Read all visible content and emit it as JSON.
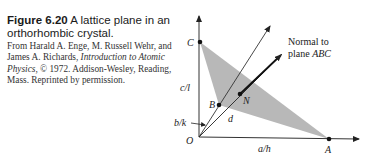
{
  "figure": {
    "number": "Figure 6.20",
    "title": "A lattice plane in an orthorhombic crystal.",
    "credit_pre": "From Harald A. Enge, M. Russell Wehr, and James A. Richards, ",
    "credit_book": "Introduction to Atomic Physics",
    "credit_post": ", © 1972. Addison-Wesley, Reading, Mass. Reprinted by permission."
  },
  "diagram": {
    "points": {
      "O": "O",
      "A": "A",
      "B": "B",
      "C": "C",
      "N": "N"
    },
    "labels": {
      "c_over_l": "c/l",
      "b_over_k": "b/k",
      "a_over_h": "a/h",
      "d": "d",
      "normal_line1": "Normal to",
      "normal_line2_pre": "plane ",
      "normal_line2_it": "ABC"
    },
    "colors": {
      "plane_fill": "#b8b8b8",
      "lines": "#222222"
    }
  }
}
